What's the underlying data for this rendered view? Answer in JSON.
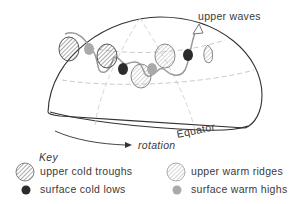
{
  "diagram": {
    "labels": {
      "upper_waves": "upper waves",
      "equator": "Equator",
      "rotation": "rotation"
    },
    "key": {
      "title": "Key",
      "items": [
        {
          "label": "upper cold troughs",
          "symbol": "hatched-circle-dark"
        },
        {
          "label": "upper warm ridges",
          "symbol": "hatched-circle-light"
        },
        {
          "label": "surface cold lows",
          "symbol": "black-dot"
        },
        {
          "label": "surface warm highs",
          "symbol": "grey-dot"
        }
      ]
    },
    "colors": {
      "outline": "#333333",
      "grid": "#bbbbbb",
      "wave": "#999999",
      "cold_low": "#2b2b2b",
      "warm_high": "#aaaaaa",
      "hatch_dark": "#555555",
      "hatch_light": "#999999"
    }
  }
}
